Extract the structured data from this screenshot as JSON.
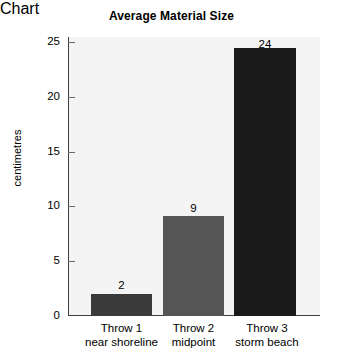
{
  "chart_data": {
    "type": "bar",
    "title": "Average Material Size",
    "xlabel": "",
    "ylabel": "centimetres",
    "categories": [
      "Throw 1 near shoreline",
      "Throw 2 midpoint",
      "Throw 3 storm beach"
    ],
    "category_lines": [
      [
        "Throw 1",
        "near shoreline"
      ],
      [
        "Throw 2",
        "midpoint"
      ],
      [
        "Throw 3",
        "storm beach"
      ]
    ],
    "values": [
      2,
      9,
      24
    ],
    "value_labels": [
      "2",
      "9",
      "24"
    ],
    "bar_colors": [
      "#3a3a3a",
      "#555555",
      "#1a1a1a"
    ],
    "ylim": [
      0,
      25
    ],
    "yticks": [
      0,
      5,
      10,
      15,
      20,
      25
    ],
    "ytick_labels": [
      "0",
      "5",
      "10",
      "15",
      "20",
      "25"
    ],
    "grid": false,
    "legend": false,
    "plot_background": "#f4f4f4",
    "axis_color": "#3c3c3c"
  }
}
